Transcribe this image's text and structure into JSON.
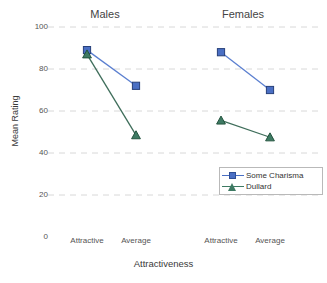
{
  "chart_data": {
    "type": "line",
    "title": "",
    "xlabel": "Attractiveness",
    "ylabel": "Mean Rating",
    "ylim": [
      0,
      100
    ],
    "yticks": [
      100,
      80,
      60,
      40,
      20,
      0
    ],
    "grid": true,
    "legend_position": "inside-lower-right",
    "panels": [
      {
        "name": "Males",
        "categories": [
          "Attractive",
          "Average"
        ],
        "series": [
          {
            "name": "Some Charisma",
            "values": [
              89,
              72
            ]
          },
          {
            "name": "Dullard",
            "values": [
              87,
              48.5
            ]
          }
        ]
      },
      {
        "name": "Females",
        "categories": [
          "Attractive",
          "Average"
        ],
        "series": [
          {
            "name": "Some Charisma",
            "values": [
              88,
              70
            ]
          },
          {
            "name": "Dullard",
            "values": [
              55.5,
              47.5
            ]
          }
        ]
      }
    ],
    "legend": [
      {
        "label": "Some Charisma",
        "color": "#4a6fc4",
        "marker": "square"
      },
      {
        "label": "Dullard",
        "color": "#3e7a63",
        "marker": "triangle"
      }
    ],
    "colors": {
      "some_charisma": "#4a6fc4",
      "dullard": "#3e7a63",
      "gridline": "#d8d8d8",
      "text": "#444444"
    }
  }
}
